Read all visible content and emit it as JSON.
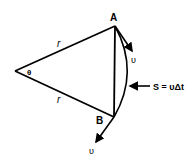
{
  "labels": {
    "point_a": "A",
    "point_b": "B",
    "radius_top": "r",
    "radius_bottom": "r",
    "angle": "θ",
    "velocity_a": "υ",
    "velocity_b": "υ",
    "arc_length": "S = υΔt"
  },
  "colors": {
    "stroke": "#000000",
    "background": "#ffffff"
  }
}
